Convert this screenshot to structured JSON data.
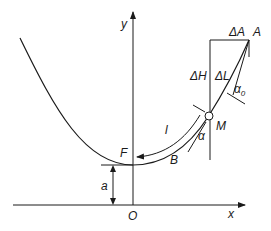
{
  "labels": {
    "y_axis": "y",
    "x_axis": "x",
    "origin": "O",
    "point_F": "F",
    "point_B": "B",
    "point_M": "M",
    "point_A": "A",
    "delta_A": "ΔA",
    "delta_H": "ΔH",
    "delta_L": "ΔL",
    "alpha0": "α",
    "alpha0_sub": "0",
    "alpha": "α",
    "arc_length": "l",
    "height_a": "a"
  },
  "colors": {
    "stroke": "#1a1a1a",
    "background": "#ffffff",
    "point_fill": "#ffffff"
  }
}
